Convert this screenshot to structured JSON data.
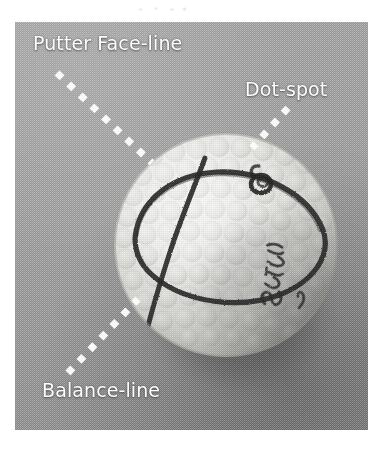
{
  "figure": {
    "kind": "annotated-photograph",
    "background_color": "#a3a3a3",
    "label_color": "#fdfdfd",
    "marker_color": "#2b2b2b",
    "ball_color": "#ededed"
  },
  "annotations": [
    {
      "id": "putter-face-line",
      "label": "Putter Face-line",
      "leader": {
        "from_x": 57,
        "from_y": 73,
        "to_x": 152,
        "to_y": 163
      }
    },
    {
      "id": "dot-spot",
      "label": "Dot-spot",
      "leader": {
        "from_x": 288,
        "from_y": 108,
        "to_x": 252,
        "to_y": 148
      }
    },
    {
      "id": "balance-line",
      "label": "Balance-line",
      "leader": {
        "from_x": 68,
        "from_y": 373,
        "to_x": 138,
        "to_y": 299
      }
    }
  ],
  "ball_markings": {
    "handwriting": "Ernest",
    "has_drawn_ring": true,
    "has_drawn_balance_line": true,
    "has_dot_spot_loop": true
  }
}
